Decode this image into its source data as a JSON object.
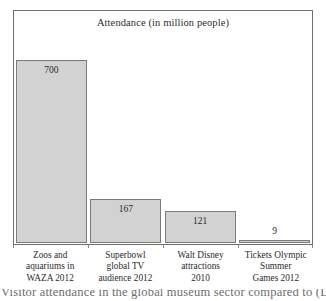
{
  "chart_data": {
    "type": "bar",
    "title": "Attendance (in million people)",
    "xlabel": "",
    "ylabel": "",
    "ylim": [
      0,
      790
    ],
    "grid": false,
    "legend": "none",
    "categories": [
      "Zoos and aquariums in WAZA 2012",
      "Superbowl global TV audience 2012",
      "Walt Disney attractions 2010",
      "Tickets Olympic Summer Games 2012"
    ],
    "category_lines": [
      [
        "Zoos and",
        "aquariums in",
        "WAZA 2012"
      ],
      [
        "Superbowl",
        "global TV",
        "audience 2012"
      ],
      [
        "Walt Disney",
        "attractions",
        "2010"
      ],
      [
        "Tickets Olympic",
        "Summer",
        "Games 2012"
      ]
    ],
    "values": [
      700,
      167,
      121,
      9
    ],
    "value_labels": [
      "700",
      "167",
      "121",
      "9"
    ],
    "bar_fill": "#d2d2d2",
    "bar_stroke": "#7a7a7a",
    "frame_color": "#6f6f6f"
  },
  "caption": {
    "clipped_line": "Visitor attendance in the global museum sector compared to (Lonsway, Brian"
  }
}
